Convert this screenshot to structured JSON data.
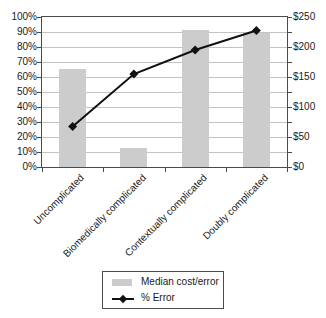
{
  "chart_data": {
    "type": "bar",
    "subtype": "combo-bar-line-dual-axis",
    "title": "",
    "xlabel": "",
    "ylabel": "",
    "categories": [
      "Uncomplicated",
      "Biomedically complicated",
      "Contextually complicated",
      "Doubly complicated"
    ],
    "series": [
      {
        "name": "Median cost/error",
        "type": "bar",
        "axis": "right",
        "unit": "USD",
        "values": [
          163,
          31,
          228,
          223
        ],
        "color": "#cccccc"
      },
      {
        "name": "% Error",
        "type": "line",
        "axis": "left",
        "unit": "percent",
        "values": [
          27,
          62,
          78,
          91
        ],
        "marker": "diamond",
        "color": "#111111"
      }
    ],
    "left_axis": {
      "min": 0,
      "max": 100,
      "tick_labels": [
        "100%",
        "90%",
        "80%",
        "70%",
        "60%",
        "50%",
        "40%",
        "30%",
        "20%",
        "10%",
        "0%"
      ]
    },
    "right_axis": {
      "min": 0,
      "max": 250,
      "tick_labels": [
        "$250",
        "$200",
        "$150",
        "$100",
        "$50",
        "$0"
      ]
    },
    "grid": true,
    "legend_position": "bottom"
  },
  "legend": {
    "items": [
      {
        "label": "Median cost/error",
        "swatch": "gray-bar"
      },
      {
        "label": "% Error",
        "swatch": "black-line-diamond"
      }
    ]
  },
  "colors": {
    "bar": "#cccccc",
    "line": "#111111",
    "grid": "#c3c3c3",
    "axis": "#4a4a4a",
    "text": "#1a1a1a",
    "background": "#ffffff"
  }
}
